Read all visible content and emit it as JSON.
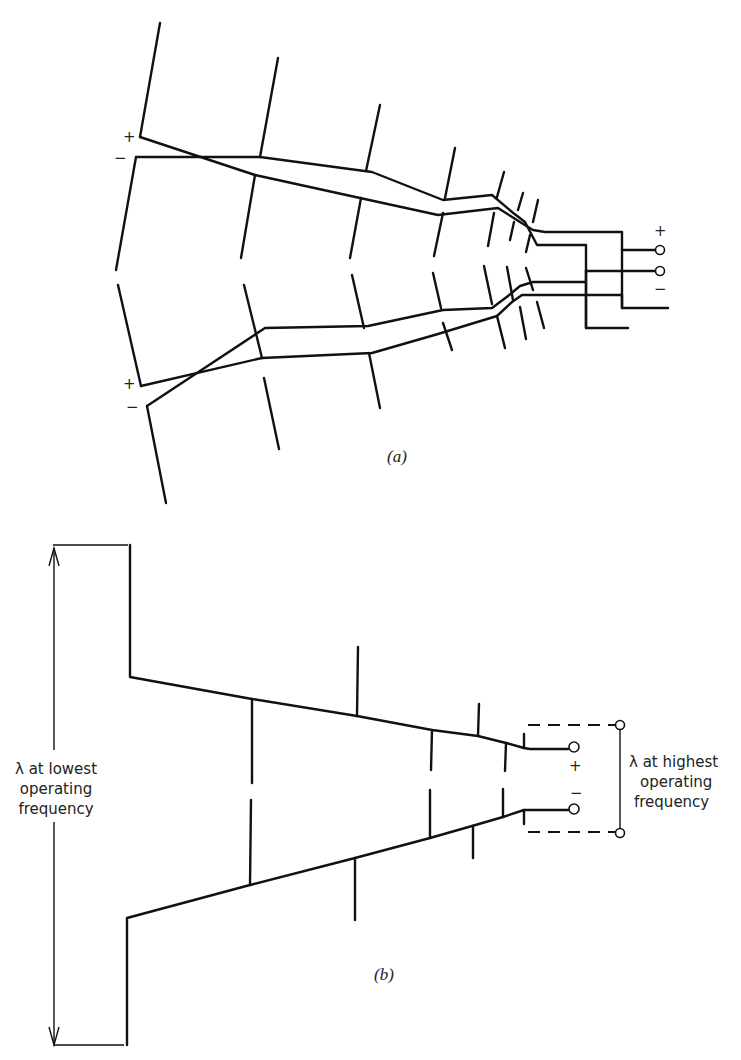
{
  "figure_a": {
    "caption": "(a)",
    "feed_plus": "+",
    "feed_minus": "−",
    "upper_element_plus": "+",
    "upper_element_minus": "−",
    "lower_element_plus": "+",
    "lower_element_minus": "−"
  },
  "figure_b": {
    "caption": "(b)",
    "terminal_plus": "+",
    "terminal_minus": "−",
    "left_dimension_label": [
      "λ at lowest",
      "operating",
      "frequency"
    ],
    "right_dimension_label": [
      "λ at highest",
      "operating",
      "frequency"
    ]
  },
  "colors": {
    "line": "#111111",
    "background": "#ffffff"
  }
}
